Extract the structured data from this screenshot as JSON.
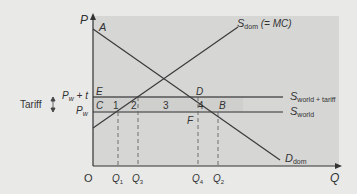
{
  "diagram": {
    "axes": {
      "y_label": "P",
      "x_label": "Q",
      "origin": "O"
    },
    "curves": {
      "supply_domestic": {
        "main": "S",
        "sub": "dom",
        "suffix": " (= MC)"
      },
      "demand_domestic": {
        "main": "D",
        "sub": "dom"
      },
      "supply_world_tariff": {
        "main": "S",
        "sub": "world + tariff"
      },
      "supply_world": {
        "main": "S",
        "sub": "world"
      }
    },
    "price_labels": {
      "pw_t": "P",
      "pw_t_sub": "w",
      "pw_t_suffix": " + t",
      "pw": "P",
      "pw_sub": "w"
    },
    "tariff_label": "Tariff",
    "points": {
      "A": "A",
      "B": "B",
      "C": "C",
      "D": "D",
      "E": "E",
      "F": "F"
    },
    "areas": {
      "a1": "1",
      "a2": "2",
      "a3": "3",
      "a4": "4"
    },
    "quantities": [
      {
        "main": "Q",
        "sub": "1"
      },
      {
        "main": "Q",
        "sub": "3"
      },
      {
        "main": "Q",
        "sub": "4"
      },
      {
        "main": "Q",
        "sub": "2"
      }
    ],
    "colors": {
      "background": "#e9e9e8",
      "plot_area": "#d6d6d5",
      "line": "#3a3a3a",
      "label": "#333333"
    }
  }
}
